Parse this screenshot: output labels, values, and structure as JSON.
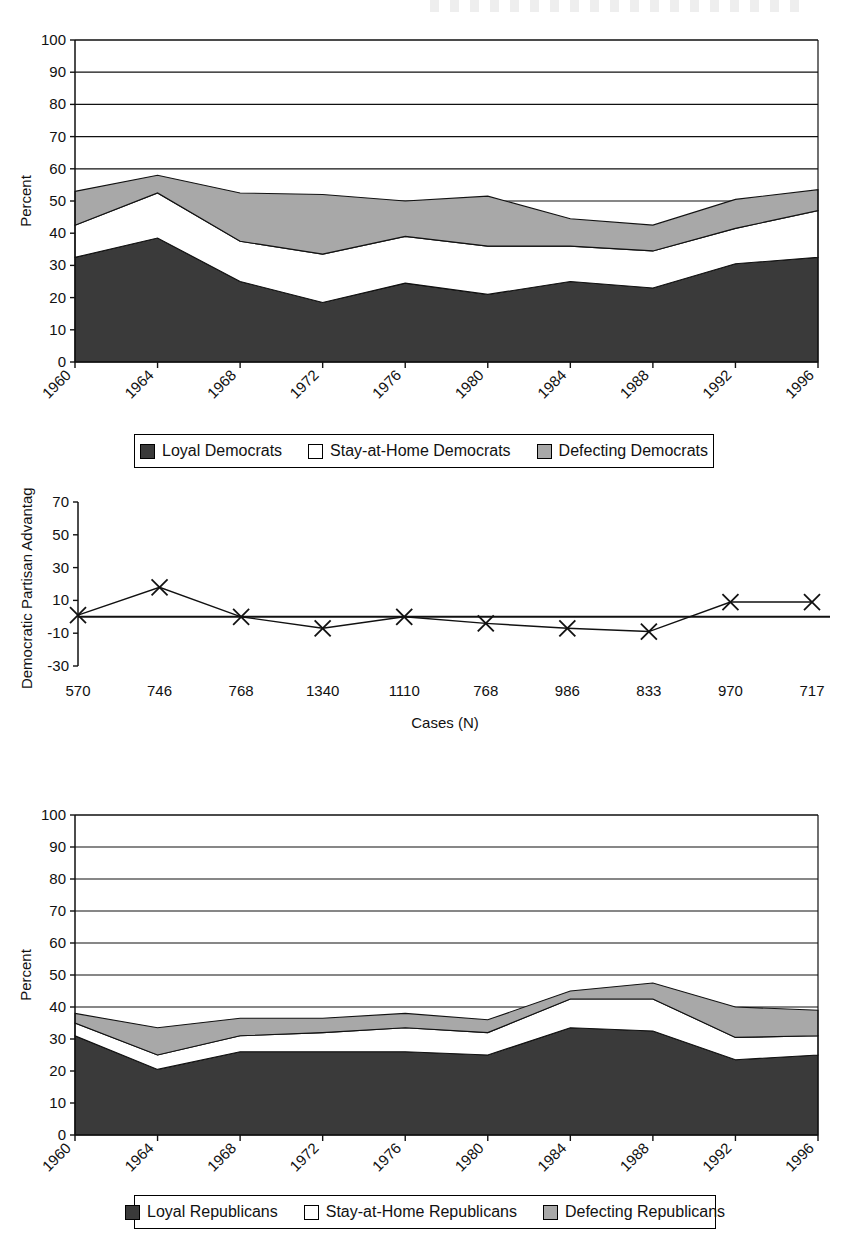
{
  "figure": {
    "background": "#ffffff",
    "ink": "#111111",
    "colors": {
      "loyal": "#3a3a3a",
      "stay_at_home": "#ffffff",
      "defecting": "#a8a8a8",
      "axis": "#111111"
    }
  },
  "chart_data": [
    {
      "id": "democrats-area-chart",
      "type": "area",
      "stacked": true,
      "title": "",
      "xlabel": "",
      "ylabel": "Percent",
      "ylim": [
        0,
        100
      ],
      "yticks": [
        0,
        10,
        20,
        30,
        40,
        50,
        60,
        70,
        80,
        90,
        100
      ],
      "grid": true,
      "legend_position": "bottom",
      "categories": [
        "1960",
        "1964",
        "1968",
        "1972",
        "1976",
        "1980",
        "1984",
        "1988",
        "1992",
        "1996"
      ],
      "series": [
        {
          "name": "Loyal Democrats",
          "color": "#3a3a3a",
          "values": [
            32.5,
            38.5,
            25.0,
            18.5,
            24.5,
            21.0,
            25.0,
            23.0,
            30.5,
            32.5
          ]
        },
        {
          "name": "Stay-at-Home Democrats",
          "color": "#ffffff",
          "values": [
            10.0,
            14.0,
            12.5,
            15.0,
            14.5,
            15.0,
            11.0,
            11.5,
            11.0,
            14.5
          ]
        },
        {
          "name": "Defecting Democrats",
          "color": "#a8a8a8",
          "values": [
            10.5,
            5.5,
            15.0,
            18.5,
            11.0,
            15.5,
            8.5,
            8.0,
            9.0,
            6.5
          ]
        }
      ],
      "cumulative_tops": {
        "loyal": [
          32.5,
          38.5,
          25.0,
          18.5,
          24.5,
          21.0,
          25.0,
          23.0,
          30.5,
          32.5
        ],
        "plus_stay": [
          42.5,
          52.5,
          37.5,
          33.5,
          39.0,
          36.0,
          36.0,
          34.5,
          41.5,
          47.0
        ],
        "plus_defect": [
          53.0,
          58.0,
          52.5,
          52.0,
          50.0,
          51.5,
          44.5,
          42.5,
          50.5,
          53.5
        ]
      }
    },
    {
      "id": "partisan-advantage-line-chart",
      "type": "line",
      "title": "",
      "xlabel": "Cases (N)",
      "ylabel": "Democratic Partisan Advantage",
      "ylim": [
        -30,
        70
      ],
      "yticks": [
        -30,
        -10,
        10,
        30,
        50,
        70
      ],
      "grid": false,
      "zero_line": true,
      "marker": "x",
      "categories": [
        "570",
        "746",
        "768",
        "1340",
        "1110",
        "768",
        "986",
        "833",
        "970",
        "717"
      ],
      "x": [
        "1960",
        "1964",
        "1968",
        "1972",
        "1976",
        "1980",
        "1984",
        "1988",
        "1992",
        "1996"
      ],
      "values": [
        1,
        18,
        0,
        -7,
        0,
        -4,
        -7,
        -9,
        9,
        9
      ]
    },
    {
      "id": "republicans-area-chart",
      "type": "area",
      "stacked": true,
      "title": "",
      "xlabel": "",
      "ylabel": "Percent",
      "ylim": [
        0,
        100
      ],
      "yticks": [
        0,
        10,
        20,
        30,
        40,
        50,
        60,
        70,
        80,
        90,
        100
      ],
      "grid": true,
      "legend_position": "bottom",
      "categories": [
        "1960",
        "1964",
        "1968",
        "1972",
        "1976",
        "1980",
        "1984",
        "1988",
        "1992",
        "1996"
      ],
      "series": [
        {
          "name": "Loyal Republicans",
          "color": "#3a3a3a",
          "values": [
            31.0,
            20.5,
            26.0,
            26.0,
            26.0,
            25.0,
            33.5,
            32.5,
            23.5,
            25.0
          ]
        },
        {
          "name": "Stay-at-Home Republicans",
          "color": "#ffffff",
          "values": [
            4.0,
            4.5,
            5.0,
            6.0,
            7.5,
            7.0,
            9.0,
            10.0,
            7.0,
            6.0
          ]
        },
        {
          "name": "Defecting Republicans",
          "color": "#a8a8a8",
          "values": [
            3.0,
            8.5,
            5.5,
            4.5,
            4.5,
            4.0,
            2.5,
            5.0,
            9.5,
            8.0
          ]
        }
      ],
      "cumulative_tops": {
        "loyal": [
          31.0,
          20.5,
          26.0,
          26.0,
          26.0,
          25.0,
          33.5,
          32.5,
          23.5,
          25.0
        ],
        "plus_stay": [
          35.0,
          25.0,
          31.0,
          32.0,
          33.5,
          32.0,
          42.5,
          42.5,
          30.5,
          31.0
        ],
        "plus_defect": [
          38.0,
          33.5,
          36.5,
          36.5,
          38.0,
          36.0,
          45.0,
          47.5,
          40.0,
          39.0
        ]
      }
    }
  ],
  "chart1": {
    "ylabel": "Percent",
    "yticks": [
      "100",
      "90",
      "80",
      "70",
      "60",
      "50",
      "40",
      "30",
      "20",
      "10",
      "0"
    ],
    "xticks": [
      "1960",
      "1964",
      "1968",
      "1972",
      "1976",
      "1980",
      "1984",
      "1988",
      "1992",
      "1996"
    ],
    "legend": [
      {
        "label": "Loyal Democrats",
        "swatch": "#3a3a3a"
      },
      {
        "label": "Stay-at-Home Democrats",
        "swatch": "#ffffff"
      },
      {
        "label": "Defecting Democrats",
        "swatch": "#a8a8a8"
      }
    ]
  },
  "chart2": {
    "ylabel": "Democratic Partisan Advantage",
    "xlabel": "Cases (N)",
    "yticks": [
      "70",
      "50",
      "30",
      "10",
      "-10",
      "-30"
    ],
    "cases": [
      "570",
      "746",
      "768",
      "1340",
      "1110",
      "768",
      "986",
      "833",
      "970",
      "717"
    ]
  },
  "chart3": {
    "ylabel": "Percent",
    "yticks": [
      "100",
      "90",
      "80",
      "70",
      "60",
      "50",
      "40",
      "30",
      "20",
      "10",
      "0"
    ],
    "xticks": [
      "1960",
      "1964",
      "1968",
      "1972",
      "1976",
      "1980",
      "1984",
      "1988",
      "1992",
      "1996"
    ],
    "legend": [
      {
        "label": "Loyal Republicans",
        "swatch": "#3a3a3a"
      },
      {
        "label": "Stay-at-Home Republicans",
        "swatch": "#ffffff"
      },
      {
        "label": "Defecting Republicans",
        "swatch": "#a8a8a8"
      }
    ]
  }
}
